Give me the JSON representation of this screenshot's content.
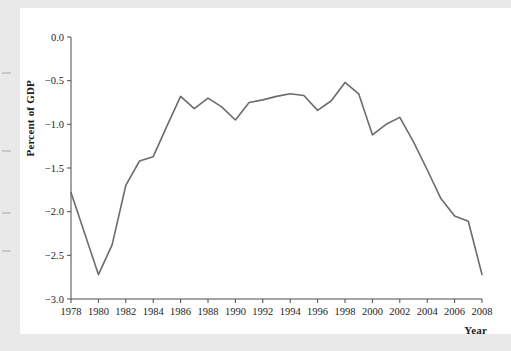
{
  "figure": {
    "background_color": "#ffffff",
    "page_margin_color": "#e9e9e9",
    "line_color": "#6b6b70",
    "axis_color": "#4a4a4a",
    "text_color": "#1c1c1c"
  },
  "chart_data": {
    "type": "line",
    "title": "",
    "subtitle": "",
    "xlabel": "Year",
    "ylabel": "Percent of GDP",
    "xlim": [
      1978,
      2008
    ],
    "ylim": [
      -3.0,
      0.0
    ],
    "grid": false,
    "legend": null,
    "legend_position": "none",
    "xticks": [
      1978,
      1980,
      1982,
      1984,
      1986,
      1988,
      1990,
      1992,
      1994,
      1996,
      1998,
      2000,
      2002,
      2004,
      2006,
      2008
    ],
    "xtick_labels": [
      "1978",
      "1980",
      "1982",
      "1984",
      "1986",
      "1988",
      "1990",
      "1992",
      "1994",
      "1996",
      "1998",
      "2000",
      "2002",
      "2004",
      "2006",
      "2008"
    ],
    "yticks": [
      0.0,
      -0.5,
      -1.0,
      -1.5,
      -2.0,
      -2.5,
      -3.0
    ],
    "ytick_labels": [
      "0.0",
      "−0.5",
      "−1.0",
      "−1.5",
      "−2.0",
      "−2.5",
      "−3.0"
    ],
    "x": [
      1978,
      1979,
      1980,
      1981,
      1982,
      1983,
      1984,
      1985,
      1986,
      1987,
      1988,
      1989,
      1990,
      1991,
      1992,
      1993,
      1994,
      1995,
      1996,
      1997,
      1998,
      1999,
      2000,
      2001,
      2002,
      2003,
      2004,
      2005,
      2006,
      2007,
      2008
    ],
    "values": [
      -1.78,
      -2.25,
      -2.72,
      -2.38,
      -1.7,
      -1.42,
      -1.37,
      -1.02,
      -0.68,
      -0.82,
      -0.7,
      -0.8,
      -0.95,
      -0.75,
      -0.72,
      -0.68,
      -0.65,
      -0.67,
      -0.84,
      -0.73,
      -0.52,
      -0.65,
      -1.12,
      -1.0,
      -0.92,
      -1.2,
      -1.52,
      -1.85,
      -2.05,
      -2.11,
      -2.72
    ],
    "series": [
      {
        "name": "Percent of GDP",
        "color": "#6b6b70",
        "values": [
          -1.78,
          -2.25,
          -2.72,
          -2.38,
          -1.7,
          -1.42,
          -1.37,
          -1.02,
          -0.68,
          -0.82,
          -0.7,
          -0.8,
          -0.95,
          -0.75,
          -0.72,
          -0.68,
          -0.65,
          -0.67,
          -0.84,
          -0.73,
          -0.52,
          -0.65,
          -1.12,
          -1.0,
          -0.92,
          -1.2,
          -1.52,
          -1.85,
          -2.05,
          -2.11,
          -2.72
        ]
      }
    ],
    "annotations": []
  }
}
